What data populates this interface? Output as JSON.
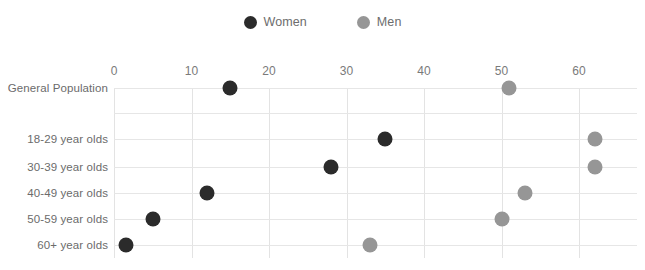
{
  "legend": {
    "items": [
      {
        "label": "Women",
        "color": "#2b2b2b",
        "icon": "circle-marker-icon"
      },
      {
        "label": "Men",
        "color": "#969696",
        "icon": "circle-marker-icon"
      }
    ]
  },
  "chart_data": {
    "type": "scatter",
    "title": "",
    "subtitle": "",
    "xlabel": "",
    "ylabel": "",
    "xlim": [
      0,
      67
    ],
    "ylim": null,
    "grid": "both",
    "legend_position": "top-center",
    "orientation": "horizontal",
    "xticks": [
      0,
      10,
      20,
      30,
      40,
      50,
      60
    ],
    "xticklabels": [
      "0",
      "10",
      "20",
      "30",
      "40",
      "50",
      "60"
    ],
    "categories": [
      "General Population",
      "",
      "18-29 year olds",
      "30-39 year olds",
      "40-49 year olds",
      "50-59 year olds",
      "60+ year olds"
    ],
    "series": [
      {
        "name": "Women",
        "color": "#2b2b2b",
        "values": [
          15,
          null,
          35,
          28,
          12,
          5,
          1.5
        ]
      },
      {
        "name": "Men",
        "color": "#969696",
        "values": [
          51,
          null,
          62,
          62,
          53,
          50,
          33
        ]
      }
    ],
    "points": [
      {
        "category": "General Population",
        "series": "Women",
        "value": 15
      },
      {
        "category": "General Population",
        "series": "Men",
        "value": 51
      },
      {
        "category": "18-29 year olds",
        "series": "Women",
        "value": 35
      },
      {
        "category": "18-29 year olds",
        "series": "Men",
        "value": 62
      },
      {
        "category": "30-39 year olds",
        "series": "Women",
        "value": 28
      },
      {
        "category": "30-39 year olds",
        "series": "Men",
        "value": 62
      },
      {
        "category": "40-49 year olds",
        "series": "Women",
        "value": 12
      },
      {
        "category": "40-49 year olds",
        "series": "Men",
        "value": 53
      },
      {
        "category": "50-59 year olds",
        "series": "Women",
        "value": 5
      },
      {
        "category": "50-59 year olds",
        "series": "Men",
        "value": 50
      },
      {
        "category": "60+ year olds",
        "series": "Women",
        "value": 1.5
      },
      {
        "category": "60+ year olds",
        "series": "Men",
        "value": 33
      }
    ]
  },
  "colors": {
    "women": "#2b2b2b",
    "men": "#969696",
    "gridline": "#e6e6e6",
    "axis": "#d9d9d9",
    "text": "#6b6b6b"
  }
}
